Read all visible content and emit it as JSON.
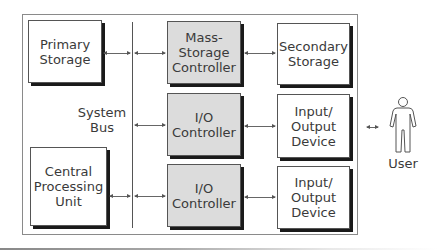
{
  "diagram": {
    "bus_label": [
      "System",
      "Bus"
    ],
    "boxes": {
      "primary_storage": [
        "Primary",
        "Storage"
      ],
      "cpu": [
        "Central",
        "Processing",
        "Unit"
      ],
      "mass_storage_controller": [
        "Mass-",
        "Storage",
        "Controller"
      ],
      "io_controller_1": [
        "I/O",
        "Controller"
      ],
      "io_controller_2": [
        "I/O",
        "Controller"
      ],
      "secondary_storage": [
        "Secondary",
        "Storage"
      ],
      "io_device_1": [
        "Input/",
        "Output",
        "Device"
      ],
      "io_device_2": [
        "Input/",
        "Output",
        "Device"
      ]
    },
    "user_label": "User",
    "colors": {
      "controller_fill": "#dcdcdc",
      "box_fill": "#ffffff",
      "shadow": "#1a1a1a"
    }
  }
}
